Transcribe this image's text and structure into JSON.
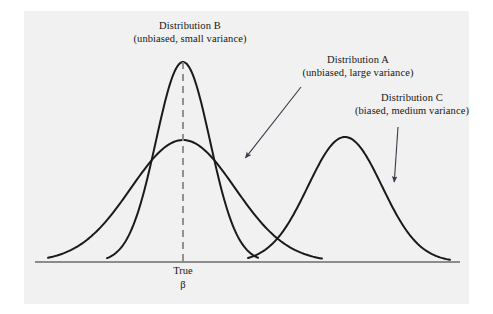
{
  "figure": {
    "kind": "sampling-distribution-diagram",
    "background_color": "#f1f1f1",
    "page_color": "#ffffff",
    "curve_color": "#1a1a1a",
    "axis_color": "#8c8c8c",
    "dashed_line_color": "#8c8c8c",
    "arrow_color": "#3a3a4a"
  },
  "labels": {
    "b": {
      "line1": "Distribution B",
      "line2": "(unbiased, small variance)"
    },
    "a": {
      "line1": "Distribution A",
      "line2": "(unbiased, large variance)"
    },
    "c": {
      "line1": "Distribution C",
      "line2": "(biased, medium variance)"
    }
  },
  "axis": {
    "tick_label_line1": "True",
    "tick_label_line2": "β"
  },
  "chart_data": {
    "type": "line",
    "title": "",
    "xlabel": "",
    "ylabel": "",
    "grid": false,
    "legend_position": "inline-annotations",
    "baseline_y_px": 262,
    "x_axis_range_px": [
      35,
      460
    ],
    "true_beta_x_px": 183,
    "series": [
      {
        "name": "Distribution A",
        "description": "unbiased, large variance",
        "center_x_px": 183,
        "peak_y_px": 140,
        "height_px": 122,
        "sigma_px": 52,
        "left_tail_x_px": 48,
        "right_tail_x_px": 322,
        "unbiased": true,
        "variance": "large"
      },
      {
        "name": "Distribution B",
        "description": "unbiased, small variance",
        "center_x_px": 183,
        "peak_y_px": 62,
        "height_px": 200,
        "sigma_px": 27,
        "left_tail_x_px": 107,
        "right_tail_x_px": 258,
        "unbiased": true,
        "variance": "small"
      },
      {
        "name": "Distribution C",
        "description": "biased, medium variance",
        "center_x_px": 345,
        "peak_y_px": 137,
        "height_px": 125,
        "sigma_px": 37,
        "left_tail_x_px": 248,
        "right_tail_x_px": 450,
        "unbiased": false,
        "variance": "medium"
      }
    ],
    "annotations": [
      {
        "target": "Distribution A",
        "arrow_from_px": [
          301,
          87
        ],
        "arrow_to_px": [
          243,
          161
        ]
      },
      {
        "target": "Distribution C",
        "arrow_from_px": [
          398,
          127
        ],
        "arrow_to_px": [
          394,
          186
        ]
      }
    ],
    "reference_line": {
      "label": "True β",
      "x_px": 183,
      "from_y_px": 62,
      "to_y_px": 262,
      "style": "dashed"
    }
  }
}
